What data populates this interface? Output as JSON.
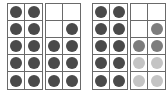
{
  "colors": {
    "dark": "#4a4a4a",
    "medium": "#7d7d7d",
    "light": "#c4c4c4",
    "empty": "transparent"
  },
  "frames": [
    {
      "left": 7,
      "cells": [
        "dark",
        "dark",
        "dark",
        "dark",
        "dark",
        "dark",
        "dark",
        "dark",
        "dark",
        "dark"
      ]
    },
    {
      "left": 45,
      "cells": [
        "empty",
        "empty",
        "empty",
        "dark",
        "dark",
        "dark",
        "dark",
        "dark",
        "dark",
        "dark"
      ]
    },
    {
      "left": 92,
      "cells": [
        "dark",
        "dark",
        "dark",
        "dark",
        "dark",
        "dark",
        "dark",
        "dark",
        "dark",
        "dark"
      ]
    },
    {
      "left": 130,
      "cells": [
        "empty",
        "empty",
        "empty",
        "medium",
        "medium",
        "medium",
        "light",
        "light",
        "light",
        "light"
      ]
    }
  ]
}
